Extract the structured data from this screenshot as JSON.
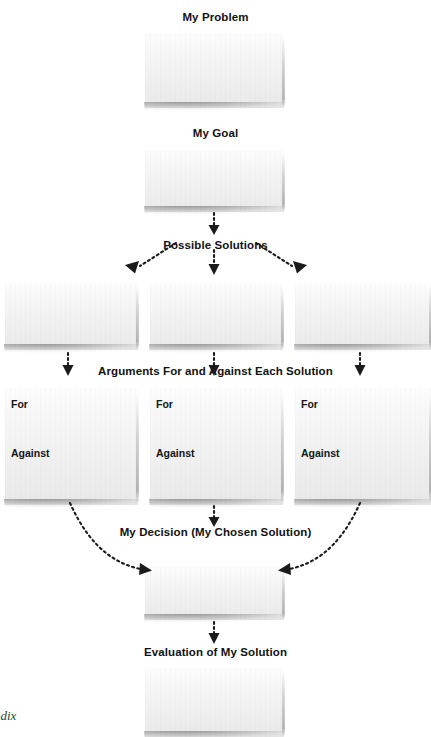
{
  "diagram": {
    "type": "flowchart",
    "background_color": "#ffffff",
    "text_color": "#121212",
    "paper_color": "#f2f2f2",
    "arrow_color": "#1b1b1b",
    "arrow_style": "dotted"
  },
  "stages": {
    "problem": {
      "label": "My Problem"
    },
    "goal": {
      "label": "My Goal"
    },
    "possible_solutions": {
      "label": "Possible Solutions"
    },
    "arguments": {
      "label": "Arguments For and Against Each Solution"
    },
    "decision": {
      "label": "My Decision (My Chosen Solution)"
    },
    "evaluation": {
      "label": "Evaluation of My Solution"
    }
  },
  "solution_boxes": [
    {
      "name": "solution-1"
    },
    {
      "name": "solution-2"
    },
    {
      "name": "solution-3"
    }
  ],
  "argument_boxes": [
    {
      "for_label": "For",
      "against_label": "Against"
    },
    {
      "for_label": "For",
      "against_label": "Against"
    },
    {
      "for_label": "For",
      "against_label": "Against"
    }
  ],
  "write_areas": {
    "problem_box": "",
    "goal_box": "",
    "decision_box": "",
    "evaluation_box": ""
  },
  "footer": {
    "partial_text": "ndix"
  }
}
